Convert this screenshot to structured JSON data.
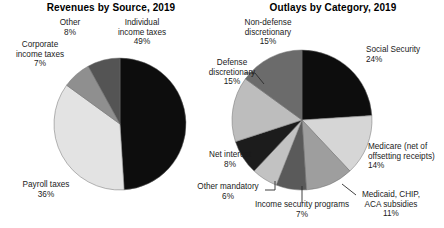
{
  "figure": {
    "background": "#ffffff",
    "colors": {
      "black": "#0d0d0d",
      "near_black": "#1c1c1c",
      "dark_gray": "#545454",
      "mid_gray": "#8f8f8f",
      "light_gray": "#d6d6d6",
      "pale_gray": "#e3e3e3",
      "outline": "#6e6e6e"
    }
  },
  "chart_data": [
    {
      "type": "pie",
      "title": "Revenues by Source, 2019",
      "xlabel": "",
      "ylabel": "",
      "legend": "none",
      "labels_inline": true,
      "start_angle_deg": 0,
      "direction": "clockwise",
      "categories": [
        "Individual income taxes",
        "Payroll taxes",
        "Corporate income taxes",
        "Other"
      ],
      "values": [
        49,
        36,
        7,
        8
      ],
      "value_labels": [
        "49%",
        "36%",
        "7%",
        "8%"
      ],
      "slice_colors": [
        "#0d0d0d",
        "#e3e3e3",
        "#8f8f8f",
        "#545454"
      ],
      "annotations": [
        {
          "text": "Individual\nincome taxes\n49%",
          "position": "top-right"
        },
        {
          "text": "Other\n8%",
          "position": "top-center"
        },
        {
          "text": "Corporate\nincome taxes\n7%",
          "position": "top-left"
        },
        {
          "text": "Payroll taxes\n36%",
          "position": "bottom-left"
        }
      ]
    },
    {
      "type": "pie",
      "title": "Outlays by Category, 2019",
      "xlabel": "",
      "ylabel": "",
      "legend": "none",
      "labels_inline": true,
      "start_angle_deg": 0,
      "direction": "clockwise",
      "categories": [
        "Social Security",
        "Medicare (net of offsetting receipts)",
        "Medicaid, CHIP, ACA subsidies",
        "Income security programs",
        "Other mandatory",
        "Net interest",
        "Defense discretionary",
        "Non-defense discretionary"
      ],
      "values": [
        24,
        14,
        11,
        7,
        6,
        8,
        15,
        15
      ],
      "value_labels": [
        "24%",
        "14%",
        "11%",
        "7%",
        "6%",
        "8%",
        "15%",
        "15%"
      ],
      "slice_colors": [
        "#0d0d0d",
        "#d6d6d6",
        "#9e9e9e",
        "#5a5a5a",
        "#c2c2c2",
        "#1c1c1c",
        "#bdbdbd",
        "#6b6b6b"
      ],
      "annotations": [
        {
          "text": "Social Security\n24%",
          "position": "right-top"
        },
        {
          "text": "Medicare (net of\noffsetting receipts)\n14%",
          "position": "right-bottom"
        },
        {
          "text": "Medicaid, CHIP,\nACA subsidies\n11%",
          "position": "bottom-right"
        },
        {
          "text": "Income security programs\n7%",
          "position": "bottom-center"
        },
        {
          "text": "Other mandatory\n6%",
          "position": "bottom-left"
        },
        {
          "text": "Net interest\n8%",
          "position": "left-bottom"
        },
        {
          "text": "Defense\ndiscretionary\n15%",
          "position": "left-top"
        },
        {
          "text": "Non-defense\ndiscretionary\n15%",
          "position": "top-left"
        }
      ]
    }
  ],
  "left_chart": {
    "title": "Revenues by Source, 2019",
    "labels": {
      "individual": "Individual\nincome taxes\n49%",
      "other": "Other\n8%",
      "corporate": "Corporate\nincome taxes\n7%",
      "payroll": "Payroll taxes\n36%"
    }
  },
  "right_chart": {
    "title": "Outlays by Category, 2019",
    "labels": {
      "social_security": "Social Security\n24%",
      "medicare": "Medicare (net of\noffsetting receipts)\n14%",
      "medicaid": "Medicaid, CHIP,\nACA subsidies\n11%",
      "income_security": "Income security programs\n7%",
      "other_mandatory": "Other mandatory\n6%",
      "net_interest": "Net interest\n8%",
      "defense": "Defense\ndiscretionary\n15%",
      "nondefense": "Non-defense\ndiscretionary\n15%"
    }
  }
}
